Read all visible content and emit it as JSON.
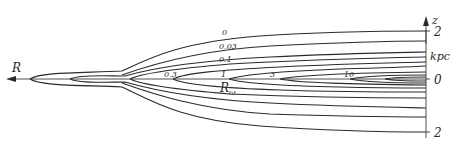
{
  "diagram": {
    "axis": {
      "label": "z",
      "unit": "kpc",
      "ticks": [
        {
          "label": "2",
          "y": 31
        },
        {
          "label": "0",
          "y": 79
        },
        {
          "label": "2",
          "y": 132
        }
      ]
    },
    "radial_axis_label": "R",
    "r_omega_label": "R",
    "r_omega_subscript": "ω",
    "contour_labels": [
      {
        "text": "0",
        "x": 230,
        "y": 37
      },
      {
        "text": "0.03",
        "x": 223,
        "y": 50
      },
      {
        "text": "0.1",
        "x": 222,
        "y": 62
      },
      {
        "text": "0.3",
        "x": 168,
        "y": 76
      },
      {
        "text": "1",
        "x": 223,
        "y": 77
      },
      {
        "text": "3",
        "x": 272,
        "y": 77
      },
      {
        "text": "10",
        "x": 346,
        "y": 78
      }
    ]
  }
}
